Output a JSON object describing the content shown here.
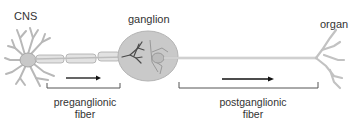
{
  "diagram": {
    "type": "autonomic-neuron-pathway",
    "labels": {
      "cns": "CNS",
      "ganglion": "ganglion",
      "organ": "organ"
    },
    "captions": {
      "preganglionic": {
        "line1": "preganglionic",
        "line2": "fiber"
      },
      "postganglionic": {
        "line1": "postganglionic",
        "line2": "fiber"
      }
    },
    "arrows": [
      {
        "name": "preganglionic-direction",
        "direction": "right"
      },
      {
        "name": "postganglionic-direction",
        "direction": "right"
      }
    ],
    "colors": {
      "neuron_fill": "#d6d6d6",
      "neuron_stroke": "#a8a8a8",
      "ganglion_fill": "#c9c9c9",
      "ganglion_stroke": "#b0b0b0",
      "dendrite_dark": "#444444",
      "text": "#333333",
      "arrow": "#111111",
      "bracket": "#555555"
    }
  }
}
